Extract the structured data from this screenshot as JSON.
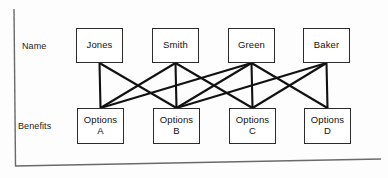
{
  "figure": {
    "axis": {
      "vertical_line": "left-axis-line",
      "horizontal_line": "bottom-axis-line"
    },
    "row_labels": [
      {
        "id": "name-row-label",
        "text": "Name"
      },
      {
        "id": "benefits-row-label",
        "text": "Benefits"
      }
    ],
    "top_row": {
      "label": "Name",
      "nodes": [
        {
          "id": "jones",
          "text": "Jones",
          "x": 76,
          "y": 28,
          "w": 47,
          "h": 35
        },
        {
          "id": "smith",
          "text": "Smith",
          "x": 152,
          "y": 28,
          "w": 47,
          "h": 35
        },
        {
          "id": "green",
          "text": "Green",
          "x": 228,
          "y": 28,
          "w": 47,
          "h": 35
        },
        {
          "id": "baker",
          "text": "Baker",
          "x": 303,
          "y": 28,
          "w": 47,
          "h": 35
        }
      ]
    },
    "bottom_row": {
      "label": "Benefits",
      "nodes": [
        {
          "id": "options-a",
          "text": "Options\nA",
          "x": 77,
          "y": 108,
          "w": 47,
          "h": 36
        },
        {
          "id": "options-b",
          "text": "Options\nB",
          "x": 153,
          "y": 108,
          "w": 47,
          "h": 36
        },
        {
          "id": "options-c",
          "text": "Options\nC",
          "x": 229,
          "y": 108,
          "w": 47,
          "h": 36
        },
        {
          "id": "options-d",
          "text": "Options\nD",
          "x": 304,
          "y": 108,
          "w": 47,
          "h": 36
        }
      ]
    },
    "edges": [
      {
        "from": "jones",
        "to": "options-a"
      },
      {
        "from": "jones",
        "to": "options-b"
      },
      {
        "from": "smith",
        "to": "options-a"
      },
      {
        "from": "smith",
        "to": "options-b"
      },
      {
        "from": "smith",
        "to": "options-c"
      },
      {
        "from": "green",
        "to": "options-a"
      },
      {
        "from": "green",
        "to": "options-b"
      },
      {
        "from": "green",
        "to": "options-c"
      },
      {
        "from": "green",
        "to": "options-d"
      },
      {
        "from": "baker",
        "to": "options-b"
      },
      {
        "from": "baker",
        "to": "options-c"
      },
      {
        "from": "baker",
        "to": "options-d"
      }
    ],
    "colors": {
      "background": "#fdfdfd",
      "box_border": "#2b2b2b",
      "box_fill": "#ffffff",
      "edge": "#111111",
      "axis": "#5a5a5a",
      "text": "#111111"
    }
  }
}
